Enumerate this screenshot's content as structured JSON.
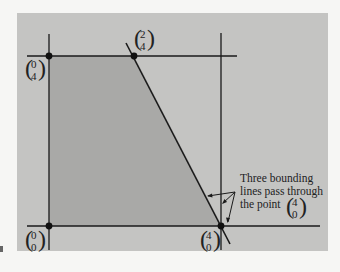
{
  "diagram": {
    "type": "feasible-region",
    "colors": {
      "background": "#f6f6f4",
      "panel": "#c4c4c2",
      "region": "#a9a9a7",
      "ink": "#1a1a1a"
    },
    "vertices": [
      {
        "id": "origin",
        "top": "0",
        "bottom": "0"
      },
      {
        "id": "y-axis-top",
        "top": "0",
        "bottom": "4"
      },
      {
        "id": "upper-corner",
        "top": "2",
        "bottom": "4"
      },
      {
        "id": "x-axis-right",
        "top": "4",
        "bottom": "0"
      }
    ],
    "annotation": {
      "lines": [
        "Three bounding",
        "lines pass through",
        "the point"
      ],
      "point_top": "4",
      "point_bottom": "0"
    }
  }
}
